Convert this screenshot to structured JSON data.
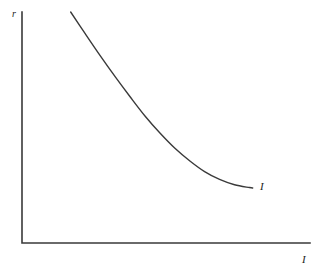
{
  "figure": {
    "background_color": "#ffffff",
    "line_color": "#3a3a3a",
    "text_color": "#1c1c1c"
  },
  "axes": {
    "y_label": "r",
    "x_label": "I",
    "origin_x": 22,
    "origin_y": 243,
    "y_top": 12,
    "x_right": 310
  },
  "curve": {
    "label": "I"
  },
  "chart_data": {
    "type": "line",
    "title": "",
    "subtitle": "",
    "xlabel": "I",
    "ylabel": "r",
    "grid": false,
    "legend": "none",
    "annotations": [
      {
        "text": "I",
        "x": 253,
        "y": 189,
        "placement": "curve-end-right"
      }
    ],
    "axis_style": "L-shaped, no ticks, no tick labels",
    "xlim": [
      0,
      1
    ],
    "ylim": [
      0,
      1
    ],
    "xticks": [],
    "yticks": [],
    "series": [
      {
        "name": "I",
        "description": "Downward-sloping convex investment demand curve",
        "x": [
          0.169,
          0.22,
          0.272,
          0.324,
          0.376,
          0.427,
          0.479,
          0.531,
          0.583,
          0.634,
          0.686,
          0.738,
          0.79,
          0.801
        ],
        "y": [
          1.0,
          0.905,
          0.81,
          0.719,
          0.632,
          0.55,
          0.476,
          0.41,
          0.355,
          0.309,
          0.275,
          0.252,
          0.24,
          0.238
        ]
      }
    ]
  }
}
